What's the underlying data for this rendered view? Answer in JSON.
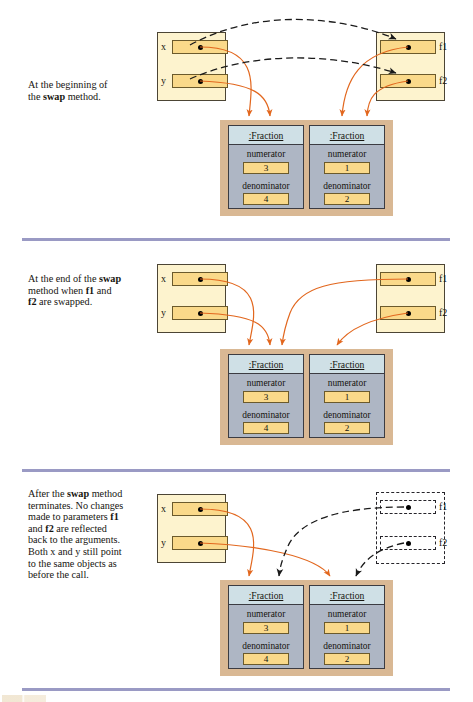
{
  "figure": {
    "type": "object-reference-swap-diagram",
    "panel_count": 3,
    "colors": {
      "frame_fill": "#fdf3ce",
      "frame_border": "#4c4535",
      "slot_fill": "#fad98a",
      "slot_border": "#6b5a2c",
      "heap_fill": "#d9b894",
      "object_fill": "#aeb6c4",
      "object_header_fill": "#cfe0e6",
      "object_border": "#3c3c42",
      "reference_arrow": "#e2671e",
      "parameter_arrow": "#1a1a1a",
      "separator": "#9a9ac4",
      "text": "#16140f"
    }
  },
  "panels": [
    {
      "id": "panel-1",
      "caption_html": "At the beginning of<br>the <b>swap</b> method.",
      "caption_plain": "At the beginning of the swap method.",
      "caller_frame": {
        "name": "caller-frame",
        "variables": [
          {
            "label": "x",
            "value": "reference-dot"
          },
          {
            "label": "y",
            "value": "reference-dot"
          }
        ],
        "style": "solid"
      },
      "method_frame": {
        "name": "swap-frame",
        "variables": [
          {
            "label": "f1",
            "value": "reference-dot"
          },
          {
            "label": "f2",
            "value": "reference-dot"
          }
        ],
        "style": "solid"
      },
      "objects": [
        {
          "title": ":Fraction",
          "fields": [
            {
              "name": "numerator",
              "value": "3"
            },
            {
              "name": "denominator",
              "value": "4"
            }
          ]
        },
        {
          "title": ":Fraction",
          "fields": [
            {
              "name": "numerator",
              "value": "1"
            },
            {
              "name": "denominator",
              "value": "2"
            }
          ]
        }
      ],
      "references": [
        {
          "from": "x",
          "to": "fraction-3-4",
          "color": "#e2671e"
        },
        {
          "from": "y",
          "to": "fraction-1-2",
          "color": "#e2671e"
        },
        {
          "from": "f1",
          "to": "fraction-3-4",
          "color": "#e2671e"
        },
        {
          "from": "f2",
          "to": "fraction-1-2",
          "color": "#e2671e"
        },
        {
          "from": "x",
          "to": "f1",
          "color": "#1a1a1a",
          "style": "dashed"
        },
        {
          "from": "y",
          "to": "f2",
          "color": "#1a1a1a",
          "style": "dashed"
        }
      ]
    },
    {
      "id": "panel-2",
      "caption_html": "At the end of the <b>swap</b><br>method when <b>f1</b> and<br><b>f2</b> are swapped.",
      "caption_plain": "At the end of the swap method when f1 and f2 are swapped.",
      "caller_frame": {
        "name": "caller-frame",
        "variables": [
          {
            "label": "x",
            "value": "reference-dot"
          },
          {
            "label": "y",
            "value": "reference-dot"
          }
        ],
        "style": "solid"
      },
      "method_frame": {
        "name": "swap-frame",
        "variables": [
          {
            "label": "f1",
            "value": "reference-dot"
          },
          {
            "label": "f2",
            "value": "reference-dot"
          }
        ],
        "style": "solid"
      },
      "objects": [
        {
          "title": ":Fraction",
          "fields": [
            {
              "name": "numerator",
              "value": "3"
            },
            {
              "name": "denominator",
              "value": "4"
            }
          ]
        },
        {
          "title": ":Fraction",
          "fields": [
            {
              "name": "numerator",
              "value": "1"
            },
            {
              "name": "denominator",
              "value": "2"
            }
          ]
        }
      ],
      "references": [
        {
          "from": "x",
          "to": "fraction-3-4",
          "color": "#e2671e"
        },
        {
          "from": "y",
          "to": "fraction-1-2",
          "color": "#e2671e"
        },
        {
          "from": "f1",
          "to": "fraction-1-2",
          "color": "#e2671e"
        },
        {
          "from": "f2",
          "to": "fraction-3-4",
          "color": "#e2671e"
        }
      ]
    },
    {
      "id": "panel-3",
      "caption_html": "After the <b>swap</b> method<br>terminates. No changes<br>made to parameters <b>f1</b><br>and <b>f2</b> are reflected<br>back to the arguments.<br>Both x and y still point<br>to the same objects as<br>before the call.",
      "caption_plain": "After the swap method terminates. No changes made to parameters f1 and f2 are reflected back to the arguments. Both x and y still point to the same objects as before the call.",
      "caller_frame": {
        "name": "caller-frame",
        "variables": [
          {
            "label": "x",
            "value": "reference-dot"
          },
          {
            "label": "y",
            "value": "reference-dot"
          }
        ],
        "style": "solid"
      },
      "method_frame": {
        "name": "swap-frame-destroyed",
        "variables": [
          {
            "label": "f1",
            "value": "reference-dot"
          },
          {
            "label": "f2",
            "value": "reference-dot"
          }
        ],
        "style": "dashed"
      },
      "objects": [
        {
          "title": ":Fraction",
          "fields": [
            {
              "name": "numerator",
              "value": "3"
            },
            {
              "name": "denominator",
              "value": "4"
            }
          ]
        },
        {
          "title": ":Fraction",
          "fields": [
            {
              "name": "numerator",
              "value": "1"
            },
            {
              "name": "denominator",
              "value": "2"
            }
          ]
        }
      ],
      "references": [
        {
          "from": "x",
          "to": "fraction-3-4",
          "color": "#e2671e"
        },
        {
          "from": "y",
          "to": "fraction-1-2",
          "color": "#e2671e"
        },
        {
          "from": "f1",
          "to": "fraction-1-2",
          "color": "#1a1a1a",
          "style": "dashed"
        },
        {
          "from": "f2",
          "to": "fraction-3-4",
          "color": "#1a1a1a",
          "style": "dashed"
        }
      ]
    }
  ]
}
